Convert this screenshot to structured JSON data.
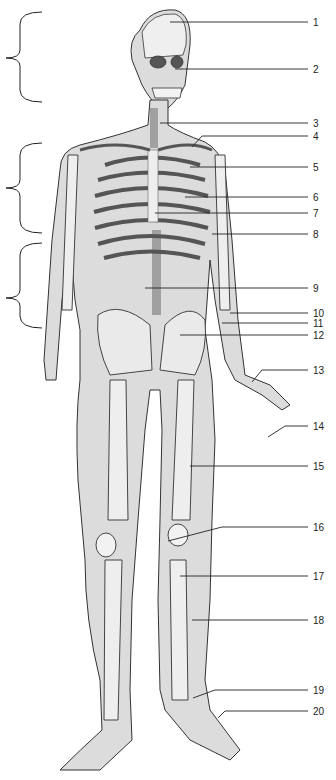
{
  "diagram": {
    "background": "#ffffff",
    "body_fill": "#d9d9d9",
    "bone_fill": "#eeeeee",
    "outline": "#333333",
    "brackets": [
      {
        "id": "bracket-head",
        "top": 12,
        "bottom": 102,
        "mid": 58
      },
      {
        "id": "bracket-thorax",
        "top": 143,
        "bottom": 233,
        "mid": 188
      },
      {
        "id": "bracket-abdomen",
        "top": 243,
        "bottom": 328,
        "mid": 298
      }
    ],
    "labels": [
      {
        "num": "1",
        "y": 22,
        "x1": 170,
        "angled": false
      },
      {
        "num": "2",
        "y": 69,
        "x1": 175,
        "angled": false
      },
      {
        "num": "3",
        "y": 123,
        "x1": 160,
        "angled": false
      },
      {
        "num": "4",
        "y": 136,
        "x1": 202,
        "angled": true,
        "tx": 192,
        "ty": 147
      },
      {
        "num": "5",
        "y": 167,
        "x1": 190,
        "angled": false
      },
      {
        "num": "6",
        "y": 197,
        "x1": 185,
        "angled": false
      },
      {
        "num": "7",
        "y": 213,
        "x1": 155,
        "angled": false
      },
      {
        "num": "8",
        "y": 234,
        "x1": 212,
        "angled": false
      },
      {
        "num": "9",
        "y": 288,
        "x1": 145,
        "angled": false
      },
      {
        "num": "10",
        "y": 313,
        "x1": 230,
        "angled": false
      },
      {
        "num": "11",
        "y": 323,
        "x1": 222,
        "angled": false
      },
      {
        "num": "12",
        "y": 335,
        "x1": 180,
        "angled": false
      },
      {
        "num": "13",
        "y": 370,
        "x1": 262,
        "angled": true,
        "tx": 252,
        "ty": 382
      },
      {
        "num": "14",
        "y": 426,
        "x1": 285,
        "angled": true,
        "tx": 268,
        "ty": 437
      },
      {
        "num": "15",
        "y": 466,
        "x1": 190,
        "angled": false
      },
      {
        "num": "16",
        "y": 527,
        "x1": 222,
        "angled": true,
        "tx": 168,
        "ty": 541
      },
      {
        "num": "17",
        "y": 576,
        "x1": 180,
        "angled": false
      },
      {
        "num": "18",
        "y": 620,
        "x1": 192,
        "angled": false
      },
      {
        "num": "19",
        "y": 690,
        "x1": 215,
        "angled": true,
        "tx": 193,
        "ty": 698
      },
      {
        "num": "20",
        "y": 711,
        "x1": 225,
        "angled": true,
        "tx": 218,
        "ty": 718
      }
    ],
    "label_x2": 308,
    "label_num_x": 313
  }
}
